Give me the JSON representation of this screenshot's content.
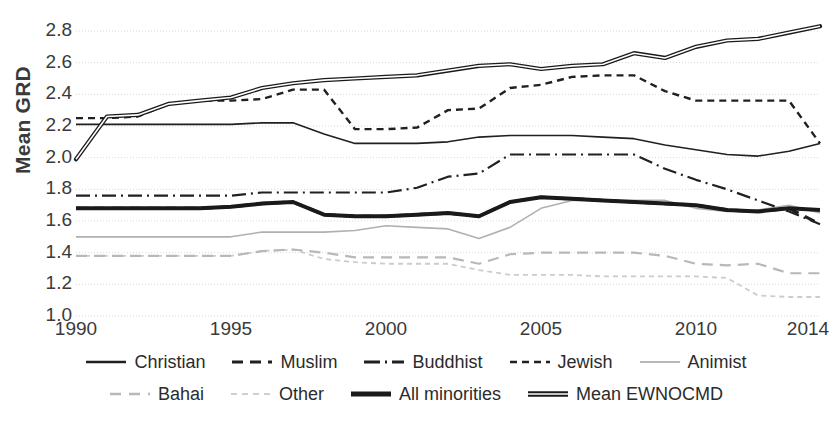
{
  "chart_data": {
    "type": "line",
    "title": "",
    "xlabel": "",
    "ylabel": "Mean GRD",
    "xlim": [
      1990,
      2014
    ],
    "ylim": [
      1.0,
      2.8
    ],
    "grid": true,
    "legend_position": "bottom",
    "x": [
      1990,
      1991,
      1992,
      1993,
      1994,
      1995,
      1996,
      1997,
      1998,
      1999,
      2000,
      2001,
      2002,
      2003,
      2004,
      2005,
      2006,
      2007,
      2008,
      2009,
      2010,
      2011,
      2012,
      2013,
      2014
    ],
    "xticks": [
      "1990",
      "1995",
      "2000",
      "2005",
      "2010",
      "2014"
    ],
    "xtick_values": [
      1990,
      1995,
      2000,
      2005,
      2010,
      2014
    ],
    "yticks": [
      "1.0",
      "1.2",
      "1.4",
      "1.6",
      "1.8",
      "2.0",
      "2.2",
      "2.4",
      "2.6",
      "2.8"
    ],
    "ytick_values": [
      1.0,
      1.2,
      1.4,
      1.6,
      1.8,
      2.0,
      2.2,
      2.4,
      2.6,
      2.8
    ],
    "series": [
      {
        "name": "Christian",
        "style": "solid",
        "color": "#231f20",
        "width": 1.6,
        "values": [
          2.21,
          2.21,
          2.21,
          2.21,
          2.21,
          2.21,
          2.22,
          2.22,
          2.15,
          2.09,
          2.09,
          2.09,
          2.1,
          2.13,
          2.14,
          2.14,
          2.14,
          2.13,
          2.12,
          2.08,
          2.05,
          2.02,
          2.01,
          2.04,
          2.09
        ]
      },
      {
        "name": "Muslim",
        "style": "dashed-wide",
        "color": "#231f20",
        "width": 3.2,
        "values": [
          1.68,
          1.68,
          1.68,
          1.68,
          1.68,
          1.69,
          1.71,
          1.72,
          1.64,
          1.63,
          1.63,
          1.64,
          1.65,
          1.63,
          1.72,
          1.75,
          1.74,
          1.73,
          1.72,
          1.71,
          1.7,
          1.67,
          1.66,
          1.68,
          1.58
        ]
      },
      {
        "name": "Buddhist",
        "style": "dash-dot",
        "color": "#231f20",
        "width": 2.2,
        "values": [
          1.76,
          1.76,
          1.76,
          1.76,
          1.76,
          1.76,
          1.78,
          1.78,
          1.78,
          1.78,
          1.78,
          1.81,
          1.88,
          1.9,
          2.02,
          2.02,
          2.02,
          2.02,
          2.02,
          1.93,
          1.86,
          1.8,
          1.73,
          1.66,
          1.58
        ]
      },
      {
        "name": "Jewish",
        "style": "dashed",
        "color": "#231f20",
        "width": 2.4,
        "values": [
          2.25,
          2.25,
          2.26,
          2.34,
          2.36,
          2.36,
          2.37,
          2.43,
          2.43,
          2.18,
          2.18,
          2.19,
          2.3,
          2.31,
          2.44,
          2.46,
          2.51,
          2.52,
          2.52,
          2.42,
          2.36,
          2.36,
          2.36,
          2.36,
          2.09
        ]
      },
      {
        "name": "Animist",
        "style": "solid",
        "color": "#b0b0b0",
        "width": 1.6,
        "values": [
          1.5,
          1.5,
          1.5,
          1.5,
          1.5,
          1.5,
          1.53,
          1.53,
          1.53,
          1.54,
          1.57,
          1.56,
          1.55,
          1.49,
          1.56,
          1.68,
          1.73,
          1.73,
          1.73,
          1.73,
          1.68,
          1.66,
          1.67,
          1.7,
          1.65
        ]
      },
      {
        "name": "Bahai",
        "style": "dashed-wide",
        "color": "#b8b8b8",
        "width": 2.2,
        "values": [
          1.38,
          1.38,
          1.38,
          1.38,
          1.38,
          1.38,
          1.41,
          1.42,
          1.4,
          1.37,
          1.37,
          1.37,
          1.37,
          1.33,
          1.39,
          1.4,
          1.4,
          1.4,
          1.4,
          1.38,
          1.33,
          1.32,
          1.33,
          1.27,
          1.27
        ]
      },
      {
        "name": "Other",
        "style": "dotted-dash",
        "color": "#cccccc",
        "width": 1.8,
        "values": [
          1.38,
          1.38,
          1.38,
          1.38,
          1.38,
          1.38,
          1.41,
          1.42,
          1.36,
          1.34,
          1.33,
          1.33,
          1.33,
          1.29,
          1.26,
          1.26,
          1.26,
          1.25,
          1.25,
          1.25,
          1.25,
          1.24,
          1.13,
          1.12,
          1.12
        ]
      },
      {
        "name": "All minorities",
        "style": "solid",
        "color": "#1a1a1a",
        "width": 4.0,
        "values": [
          1.68,
          1.68,
          1.68,
          1.68,
          1.68,
          1.69,
          1.71,
          1.72,
          1.64,
          1.63,
          1.63,
          1.64,
          1.65,
          1.63,
          1.72,
          1.75,
          1.74,
          1.73,
          1.72,
          1.71,
          1.7,
          1.67,
          1.66,
          1.68,
          1.67
        ]
      },
      {
        "name": "Mean EWNOCMD",
        "style": "double",
        "color": "#1a1a1a",
        "width": 4.2,
        "values": [
          1.99,
          2.26,
          2.27,
          2.34,
          2.36,
          2.38,
          2.44,
          2.47,
          2.49,
          2.5,
          2.51,
          2.52,
          2.55,
          2.58,
          2.59,
          2.56,
          2.58,
          2.59,
          2.66,
          2.63,
          2.7,
          2.74,
          2.75,
          2.79,
          2.83
        ]
      }
    ]
  },
  "legend": {
    "row1": [
      {
        "label": "Christian",
        "swatch": "solid-thin-dark"
      },
      {
        "label": "Muslim",
        "swatch": "dashed-wide-dark"
      },
      {
        "label": "Buddhist",
        "swatch": "dash-dot-dark"
      },
      {
        "label": "Jewish",
        "swatch": "dashed-dark"
      },
      {
        "label": "Animist",
        "swatch": "solid-thin-gray"
      }
    ],
    "row2": [
      {
        "label": "Bahai",
        "swatch": "dashed-wide-gray"
      },
      {
        "label": "Other",
        "swatch": "dotted-dash-gray"
      },
      {
        "label": "All minorities",
        "swatch": "solid-thick-dark"
      },
      {
        "label": "Mean EWNOCMD",
        "swatch": "double-dark"
      }
    ]
  },
  "axis": {
    "y_title": "Mean GRD"
  }
}
